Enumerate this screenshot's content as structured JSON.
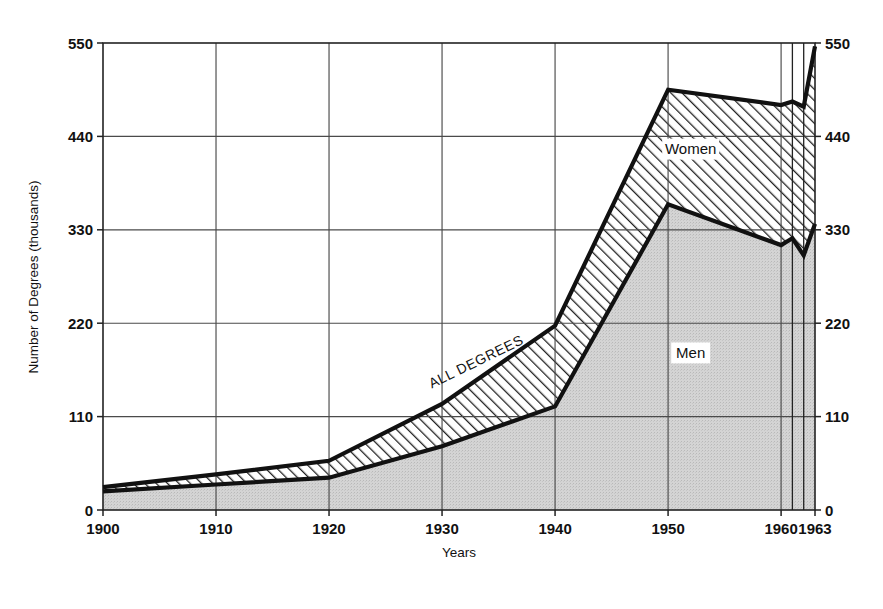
{
  "chart_data": {
    "type": "area",
    "subtype": "stacked-area",
    "title": "",
    "xlabel": "Years",
    "ylabel": "Number of Degrees (thousands)",
    "x": [
      1900,
      1910,
      1920,
      1930,
      1940,
      1950,
      1960,
      1961,
      1962,
      1963
    ],
    "xlim": [
      1900,
      1963
    ],
    "ylim": [
      0,
      550
    ],
    "xtick_labels": [
      "1900",
      "1910",
      "1920",
      "1930",
      "1940",
      "1950",
      "1960",
      "1963"
    ],
    "xtick_values": [
      1900,
      1910,
      1920,
      1930,
      1940,
      1950,
      1960,
      1963
    ],
    "ytick_labels": [
      "0",
      "110",
      "220",
      "330",
      "440",
      "550"
    ],
    "ytick_values": [
      0,
      110,
      220,
      330,
      440,
      550
    ],
    "ytick_labels_right": [
      "0",
      "110",
      "220",
      "330",
      "440",
      "550"
    ],
    "grid": true,
    "legend": "inline-labels",
    "series": [
      {
        "name": "Men",
        "label": "Men",
        "fill": "#d4d4d4",
        "pattern": "solid-gray",
        "values": [
          22,
          30,
          38,
          75,
          122,
          360,
          312,
          320,
          300,
          337
        ]
      },
      {
        "name": "Women",
        "label": "Women",
        "fill": "#ffffff",
        "pattern": "diagonal-hatch",
        "values": [
          5,
          12,
          20,
          50,
          95,
          135,
          165,
          161,
          175,
          209
        ]
      }
    ],
    "totals": {
      "name": "ALL DEGREES",
      "label": "ALL DEGREES",
      "values": [
        27,
        42,
        58,
        125,
        217,
        495,
        477,
        481,
        475,
        546
      ]
    },
    "annotations": [
      {
        "text": "ALL DEGREES",
        "x": 1933,
        "y": 175,
        "rotation": -26
      },
      {
        "text": "Women",
        "x": 1952,
        "y": 425
      },
      {
        "text": "Men",
        "x": 1952,
        "y": 185
      }
    ]
  },
  "axis": {
    "y_title": "Number of Degrees (thousands)",
    "x_title": "Years"
  },
  "colors": {
    "men_fill": "#d4d4d4",
    "women_fill": "#ffffff",
    "line": "#111111",
    "grid": "#4a4a4a",
    "background": "#ffffff"
  }
}
